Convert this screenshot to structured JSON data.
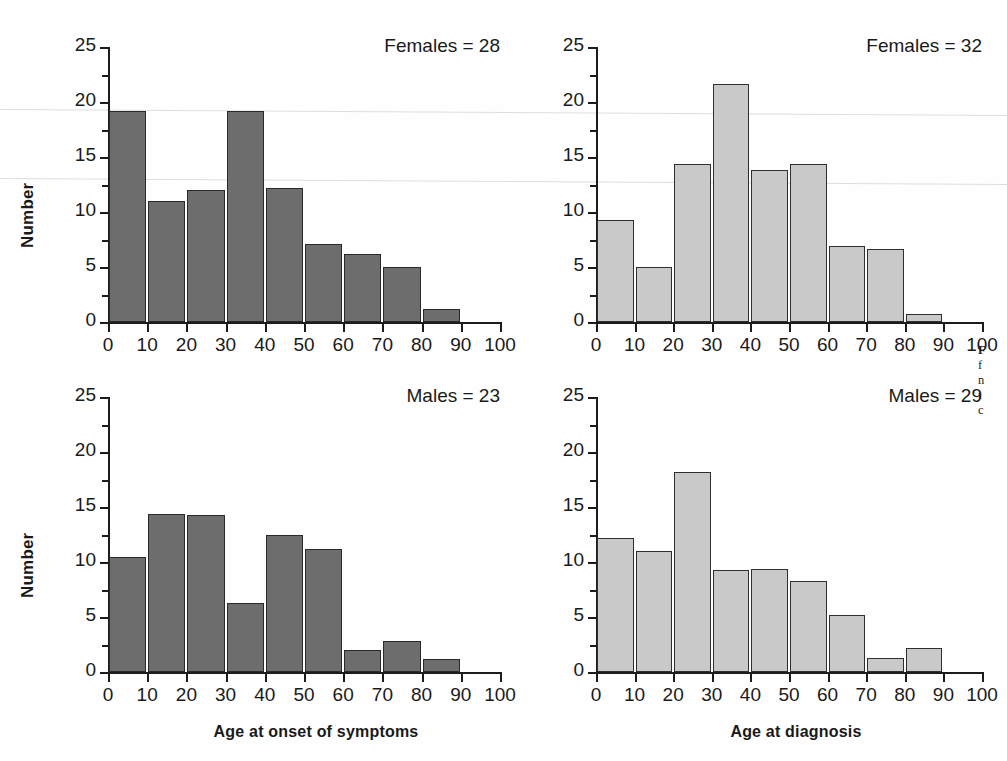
{
  "figure": {
    "axis_titles": {
      "y": "Number",
      "x_left": "Age at onset of symptoms",
      "x_right": "Age at diagnosis"
    },
    "y_ticks": [
      "0",
      "5",
      "10",
      "15",
      "20",
      "25"
    ],
    "x_ticks": [
      "0",
      "10",
      "20",
      "30",
      "40",
      "50",
      "60",
      "70",
      "80",
      "90",
      "100"
    ],
    "colors": {
      "bar_dark": "#6d6d6d",
      "bar_light": "#c9c9c9",
      "bar_outline": "#2a2a2a",
      "axis": "#1c1c1c",
      "text": "#1a1a1a",
      "background": "#fefefe"
    },
    "caption_fragment": [
      "F",
      "f",
      "n",
      "t",
      "c"
    ]
  },
  "chart_data": [
    {
      "type": "bar",
      "panel": "top-left",
      "title": "Females = 28",
      "xlabel": "Age at onset of symptoms",
      "ylabel": "Number",
      "xlim": [
        0,
        100
      ],
      "ylim": [
        0,
        25
      ],
      "bin_width": 10,
      "grid": false,
      "bar_style": "dark",
      "categories": [
        "0-10",
        "10-20",
        "20-30",
        "30-40",
        "40-50",
        "50-60",
        "60-70",
        "70-80",
        "80-90",
        "90-100"
      ],
      "bin_starts": [
        0,
        10,
        20,
        30,
        40,
        50,
        60,
        70,
        80,
        90
      ],
      "values": [
        19.2,
        11.0,
        12.0,
        19.2,
        12.2,
        7.1,
        6.2,
        5.0,
        1.2,
        0
      ]
    },
    {
      "type": "bar",
      "panel": "top-right",
      "title": "Females = 32",
      "xlabel": "Age at diagnosis",
      "ylabel": "Number",
      "xlim": [
        0,
        100
      ],
      "ylim": [
        0,
        25
      ],
      "bin_width": 10,
      "grid": false,
      "bar_style": "light",
      "categories": [
        "0-10",
        "10-20",
        "20-30",
        "30-40",
        "40-50",
        "50-60",
        "60-70",
        "70-80",
        "80-90",
        "90-100"
      ],
      "bin_starts": [
        0,
        10,
        20,
        30,
        40,
        50,
        60,
        70,
        80,
        90
      ],
      "values": [
        9.3,
        5.0,
        14.4,
        21.6,
        13.8,
        14.4,
        6.9,
        6.6,
        0.7,
        0
      ]
    },
    {
      "type": "bar",
      "panel": "bottom-left",
      "title": "Males = 23",
      "xlabel": "Age at onset of symptoms",
      "ylabel": "Number",
      "xlim": [
        0,
        100
      ],
      "ylim": [
        0,
        25
      ],
      "bin_width": 10,
      "grid": false,
      "bar_style": "dark",
      "categories": [
        "0-10",
        "10-20",
        "20-30",
        "30-40",
        "40-50",
        "50-60",
        "60-70",
        "70-80",
        "80-90",
        "90-100"
      ],
      "bin_starts": [
        0,
        10,
        20,
        30,
        40,
        50,
        60,
        70,
        80,
        90
      ],
      "values": [
        10.5,
        14.4,
        14.3,
        6.3,
        12.5,
        11.2,
        2.0,
        2.8,
        1.2,
        0
      ]
    },
    {
      "type": "bar",
      "panel": "bottom-right",
      "title": "Males = 29",
      "xlabel": "Age at diagnosis",
      "ylabel": "Number",
      "xlim": [
        0,
        100
      ],
      "ylim": [
        0,
        25
      ],
      "bin_width": 10,
      "grid": false,
      "bar_style": "light",
      "categories": [
        "0-10",
        "10-20",
        "20-30",
        "30-40",
        "40-50",
        "50-60",
        "60-70",
        "70-80",
        "80-90",
        "90-100"
      ],
      "bin_starts": [
        0,
        10,
        20,
        30,
        40,
        50,
        60,
        70,
        80,
        90
      ],
      "values": [
        12.2,
        11.0,
        18.2,
        9.3,
        9.4,
        8.3,
        5.2,
        1.3,
        2.2,
        0
      ]
    }
  ]
}
